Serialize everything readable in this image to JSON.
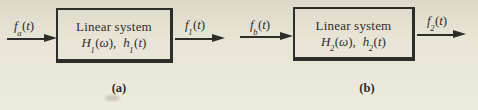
{
  "figure": {
    "background_color": "#e8e5d7",
    "ink_color": "#2f2d27",
    "diagrams": [
      {
        "id": "a",
        "caption": "(a)",
        "box": {
          "title": "Linear system",
          "transfer": {
            "base": "H",
            "sub": "1",
            "open": "(",
            "arg": "ω",
            "close": "),"
          },
          "impulse": {
            "base": "h",
            "sub": "1",
            "open": "(",
            "arg": "t",
            "close": ")"
          }
        },
        "input": {
          "base": "f",
          "sub": "a",
          "open": "(",
          "arg": "t",
          "close": ")"
        },
        "output": {
          "base": "f",
          "sub": "1",
          "open": "(",
          "arg": "t",
          "close": ")"
        }
      },
      {
        "id": "b",
        "caption": "(b)",
        "box": {
          "title": "Linear system",
          "transfer": {
            "base": "H",
            "sub": "2",
            "open": "(",
            "arg": "ω",
            "close": "),"
          },
          "impulse": {
            "base": "h",
            "sub": "2",
            "open": "(",
            "arg": "t",
            "close": ")"
          }
        },
        "input": {
          "base": "f",
          "sub": "b",
          "open": "(",
          "arg": "t",
          "close": ")"
        },
        "output": {
          "base": "f",
          "sub": "2",
          "open": "(",
          "arg": "t",
          "close": ")"
        }
      }
    ]
  }
}
